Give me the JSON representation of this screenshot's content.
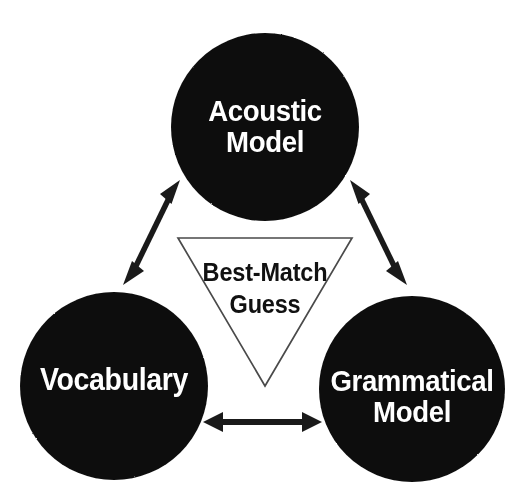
{
  "figure": {
    "background_color": "#ffffff",
    "node_fill_color": "#111111",
    "node_text_color": "#ffffff",
    "connector_color": "#1a1a1a",
    "triangle_stroke_color": "#4a4a4a",
    "crop_remnant_text": "I  I                                    I      O"
  },
  "nodes": [
    {
      "id": "acoustic-model",
      "line_1": "Acoustic",
      "line_2": "Model",
      "shape": "circle",
      "cx": 265,
      "cy": 127,
      "r": 94
    },
    {
      "id": "vocabulary",
      "line_1": "Vocabulary",
      "line_2": "",
      "shape": "circle",
      "cx": 114,
      "cy": 386,
      "r": 94
    },
    {
      "id": "grammatical-model",
      "line_1": "Grammatical",
      "line_2": "Model",
      "shape": "circle",
      "cx": 412,
      "cy": 389,
      "r": 93
    }
  ],
  "center": {
    "id": "best-match-guess",
    "line_1": "Best-Match",
    "line_2": "Guess",
    "shape": "inverted-triangle",
    "top_left_x": 178,
    "top_right_x": 352,
    "top_y": 238,
    "apex_x": 265,
    "apex_y": 386
  },
  "connectors": [
    {
      "id": "acoustic-vocabulary",
      "from": "vocabulary",
      "to": "acoustic-model",
      "style": "double-headed-arrow",
      "orientation": "diagonal-up-right"
    },
    {
      "id": "acoustic-grammatical",
      "from": "acoustic-model",
      "to": "grammatical-model",
      "style": "double-headed-arrow",
      "orientation": "diagonal-down-right"
    },
    {
      "id": "vocabulary-grammatical",
      "from": "vocabulary",
      "to": "grammatical-model",
      "style": "double-headed-arrow",
      "orientation": "horizontal"
    }
  ]
}
